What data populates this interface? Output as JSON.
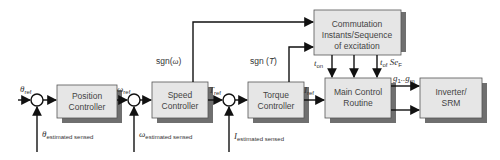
{
  "blocks": {
    "position": {
      "line1": "Position",
      "line2": "Controller"
    },
    "speed": {
      "line1": "Speed",
      "line2": "Controller"
    },
    "torque": {
      "line1": "Torque",
      "line2": "Controller"
    },
    "commutation": {
      "line1": "Commutation",
      "line2": "Instants/Sequence",
      "line3": "of excitation"
    },
    "main_control": {
      "line1": "Main Control",
      "line2": "Routine"
    },
    "inverter": {
      "line1": "Inverter/",
      "line2": "SRM"
    }
  },
  "signals": {
    "theta_ref": {
      "sym": "θ",
      "sub": "ref"
    },
    "omega_ref": {
      "sym": "ω",
      "sub": "ref"
    },
    "t_ref": {
      "sym": "T",
      "sub": "ref"
    },
    "i_ref": {
      "sym": "I",
      "sub": "ref"
    },
    "theta_fb": {
      "sym": "θ",
      "sub": "estimated sensed"
    },
    "omega_fb": {
      "sym": "ω",
      "sub": "estimated sensed"
    },
    "i_fb": {
      "sym": "I",
      "sub": "estimated sensed"
    },
    "sgn_omega": {
      "pre": "sgn(",
      "sym": "ω",
      "post": ")"
    },
    "sgn_t": {
      "pre": "sgn (",
      "sym": "T",
      "post": ")"
    },
    "t_on": {
      "sym": "t",
      "sub": "on"
    },
    "t_of_se": {
      "sym": "t",
      "sub": "of",
      "mid": " Se",
      "sub2": "F"
    },
    "gates": {
      "g1": "g",
      "g1sub": "1",
      "dots": "..",
      "gm": "g",
      "gmsub": "m"
    }
  }
}
